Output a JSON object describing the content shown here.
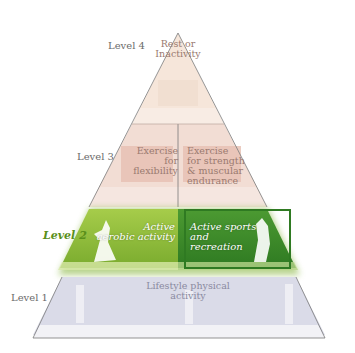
{
  "diagram": {
    "type": "physical-activity-pyramid",
    "colors": {
      "level4_fill": "#f6e6da",
      "level3_fill": "#eac9bf",
      "level3_band": "#f4e3dc",
      "level2_left": "#8bb93a",
      "level2_right": "#3f8a2a",
      "level2_border": "#2f7a22",
      "level1_fill": "#dadbe8",
      "level1_band": "#f2f2f6",
      "outline": "#7a7a7a"
    },
    "levels": [
      {
        "id": "level-4",
        "label": "Level 4",
        "segments": [
          {
            "text_lines": [
              "Rest or",
              "Inactivity"
            ]
          }
        ]
      },
      {
        "id": "level-3",
        "label": "Level 3",
        "segments": [
          {
            "text_lines": [
              "Exercise for",
              "flexibility"
            ]
          },
          {
            "text_lines": [
              "Exercise",
              "for strength",
              "& muscular",
              "endurance"
            ]
          }
        ]
      },
      {
        "id": "level-2",
        "label": "Level 2",
        "highlighted": true,
        "segments": [
          {
            "text_lines": [
              "Active",
              "aerobic activity"
            ]
          },
          {
            "text_lines": [
              "Active sports",
              "and recreation"
            ]
          }
        ]
      },
      {
        "id": "level-1",
        "label": "Level 1",
        "segments": [
          {
            "text_lines": [
              "Lifestyle physical activity"
            ]
          }
        ]
      }
    ]
  }
}
